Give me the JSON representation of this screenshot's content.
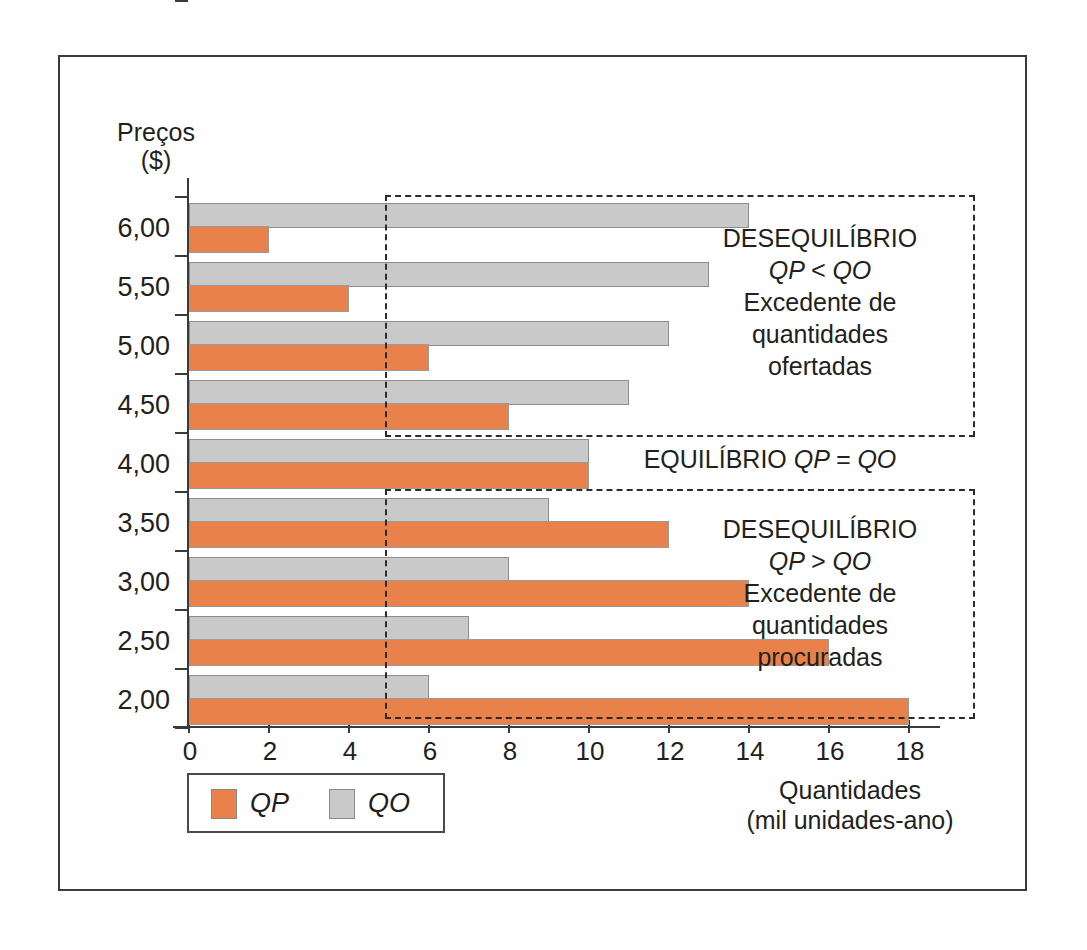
{
  "chart_data": {
    "type": "bar",
    "orientation": "horizontal",
    "title": "",
    "xlabel": "Quantidades (mil unidades-ano)",
    "ylabel": "Preços ($)",
    "xlim": [
      0,
      18
    ],
    "xticks": [
      0,
      2,
      4,
      6,
      8,
      10,
      12,
      14,
      16,
      18
    ],
    "categories": [
      "6,00",
      "5,50",
      "5,00",
      "4,50",
      "4,00",
      "3,50",
      "3,00",
      "2,50",
      "2,00"
    ],
    "series": [
      {
        "name": "QP",
        "color": "#e8824a",
        "values": [
          2,
          4,
          6,
          8,
          10,
          12,
          14,
          16,
          18
        ]
      },
      {
        "name": "QO",
        "color": "#c9c9c9",
        "values": [
          14,
          13,
          12,
          11,
          10,
          9,
          8,
          7,
          6
        ]
      }
    ],
    "grid": false,
    "legend_position": "bottom-left",
    "annotations": [
      {
        "id": "surplus-supply",
        "lines": [
          "DESEQUILÍBRIO",
          "QP < QO",
          "Excedente de",
          "quantidades",
          "ofertadas"
        ],
        "covers_categories": [
          "6,00",
          "5,50",
          "5,00",
          "4,50"
        ]
      },
      {
        "id": "equilibrium",
        "lines": [
          "EQUILÍBRIO QP = QO"
        ],
        "covers_categories": [
          "4,00"
        ]
      },
      {
        "id": "surplus-demand",
        "lines": [
          "DESEQUILÍBRIO",
          "QP > QO",
          "Excedente de",
          "quantidades",
          "procuradas"
        ],
        "covers_categories": [
          "3,50",
          "3,00",
          "2,50",
          "2,00"
        ]
      }
    ]
  },
  "axes": {
    "y_title_line1": "Preços",
    "y_title_line2": "($)",
    "x_title_line1": "Quantidades",
    "x_title_line2": "(mil unidades-ano)",
    "x_tick_labels": [
      "0",
      "2",
      "4",
      "6",
      "8",
      "10",
      "12",
      "14",
      "16",
      "18"
    ],
    "y_tick_labels": [
      "6,00",
      "5,50",
      "5,00",
      "4,50",
      "4,00",
      "3,50",
      "3,00",
      "2,50",
      "2,00"
    ]
  },
  "legend": {
    "entries": [
      {
        "label": "QP",
        "color": "#e8824a"
      },
      {
        "label": "QO",
        "color": "#c9c9c9"
      }
    ]
  },
  "annotations": {
    "top": {
      "line1": "DESEQUILÍBRIO",
      "line2": "QP < QO",
      "line3": "Excedente de",
      "line4": "quantidades",
      "line5": "ofertadas"
    },
    "middle": {
      "line1_prefix": "EQUILÍBRIO ",
      "line1_expr": "QP = QO"
    },
    "bottom": {
      "line1": "DESEQUILÍBRIO",
      "line2": "QP > QO",
      "line3": "Excedente de",
      "line4": "quantidades",
      "line5": "procuradas"
    }
  },
  "colors": {
    "qp": "#e8824a",
    "qo": "#c9c9c9",
    "axis": "#3a3a3a",
    "text": "#231f20"
  }
}
